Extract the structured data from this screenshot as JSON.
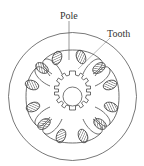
{
  "diagram": {
    "type": "stepper-motor-cross-section",
    "labels": {
      "pole": "Pole",
      "tooth": "Tooth"
    },
    "colors": {
      "line": "#4a4a4a",
      "hatch": "#6a6a6a",
      "background": "#ffffff"
    },
    "components": {
      "outer_frame": "circle",
      "stator_poles": 4,
      "coil_sections": 8,
      "rotor_teeth": 12,
      "shaft": "circle"
    }
  }
}
